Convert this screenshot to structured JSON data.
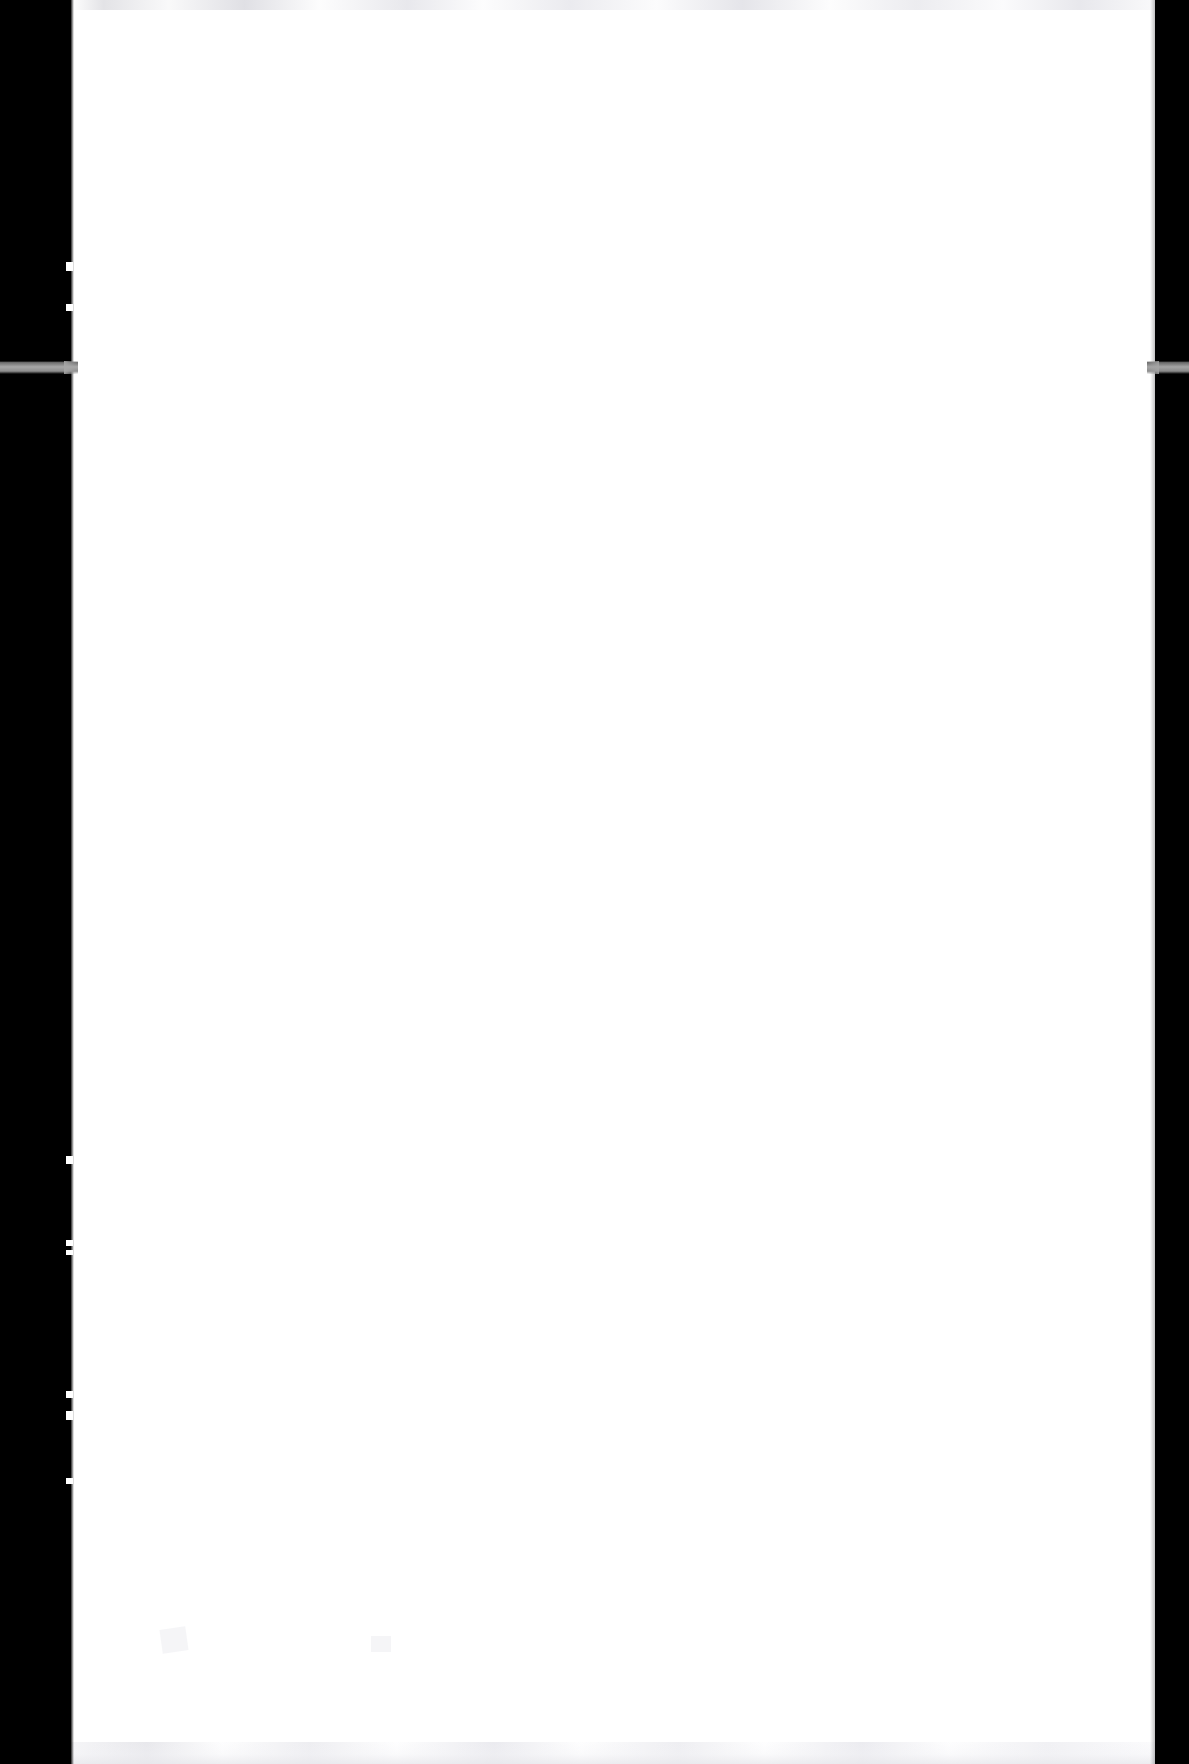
{
  "document": {
    "kind": "scanned-page-image",
    "page_condition": "blank",
    "visible_text": "",
    "body_text_lines": []
  },
  "canvas": {
    "width_px": 1189,
    "height_px": 1764,
    "background_color": "#000000"
  },
  "page_sheet": {
    "fill_color": "#ffffff",
    "left_px": 71,
    "top_px": 0,
    "width_px": 1084,
    "height_px": 1764
  },
  "scanner_bed": {
    "bar_color": "#000000",
    "left_bar": {
      "x_px": 0,
      "width_px": 71
    },
    "right_bar": {
      "x_px": 1155,
      "width_px": 34
    }
  },
  "light_band": {
    "label": "scanner light leak band",
    "color": "#a8a8a8",
    "top_px": 361,
    "height_px": 13,
    "segments": [
      {
        "side": "left",
        "x_px": 0,
        "width_px": 78
      },
      {
        "side": "right",
        "x_px": 1147,
        "width_px": 42
      }
    ]
  },
  "artifacts": {
    "top_smudge": {
      "color": "#e2e2e6",
      "top_px": 0,
      "height_px": 10
    },
    "bottom_smudge": {
      "color": "#e8e8ec",
      "bottom_px": 0,
      "height_px": 22
    },
    "left_edge": {
      "description": "jagged page edge",
      "notch_count": 8
    },
    "right_edge": {
      "description": "soft shadow gradient",
      "color": "#78787c"
    }
  }
}
